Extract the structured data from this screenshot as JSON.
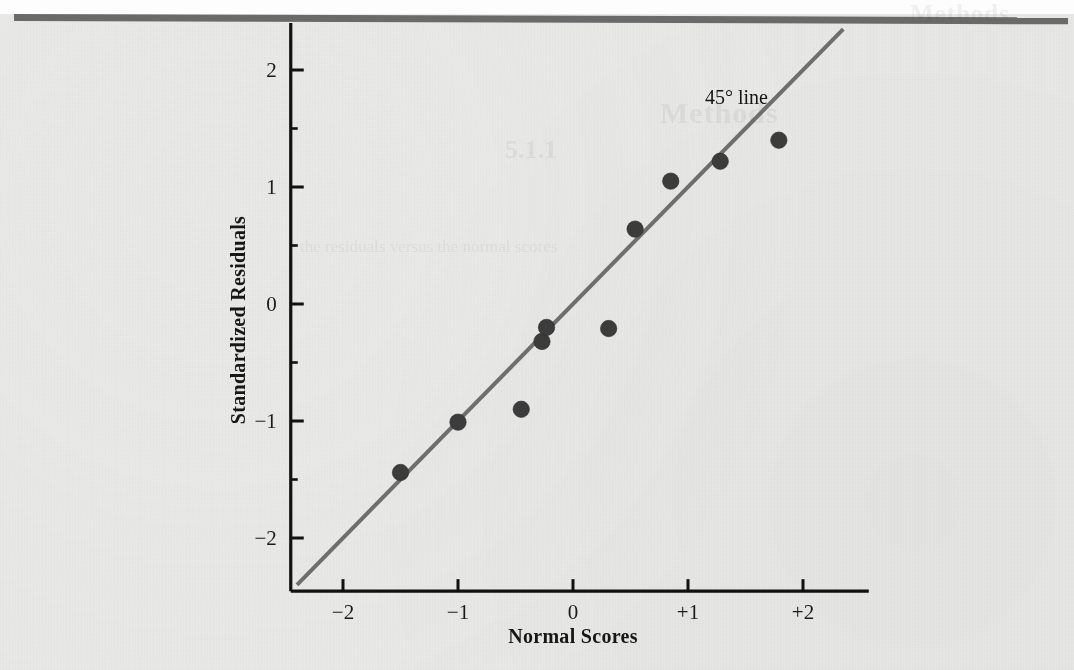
{
  "page": {
    "background_color": "#e9e9e7",
    "rule_color": "#6a6a6a"
  },
  "ghost_text": {
    "header": "Methods",
    "title": "Methods",
    "subtitle": "5.1.1",
    "body": "the residuals versus the normal scores"
  },
  "annotation": {
    "label_45": "45° line"
  },
  "chart_data": {
    "type": "scatter",
    "title": "",
    "xlabel": "Normal Scores",
    "ylabel": "Standardized Residuals",
    "xlim": [
      -2.45,
      2.45
    ],
    "ylim": [
      -2.45,
      2.3
    ],
    "grid": false,
    "legend": "none",
    "marker_color": "#3c3c3c",
    "line_color": "#6e6e6e",
    "axis_color": "#111111",
    "xticks": [
      -2,
      -1,
      0,
      1,
      2
    ],
    "xtick_labels": [
      "−2",
      "−1",
      "0",
      "+1",
      "+2"
    ],
    "yticks": [
      2,
      1,
      0,
      -1,
      -2
    ],
    "ytick_labels": [
      "2",
      "1",
      "0",
      "−1",
      "−2"
    ],
    "x": [
      -1.5,
      -1.0,
      -0.45,
      -0.27,
      -0.23,
      0.31,
      0.54,
      0.85,
      1.28,
      1.79
    ],
    "y": [
      -1.44,
      -1.01,
      -0.9,
      -0.32,
      -0.2,
      -0.21,
      0.64,
      1.05,
      1.22,
      1.4
    ],
    "reference_line": {
      "name": "45° line",
      "slope": 1,
      "intercept": 0,
      "x_start": -2.4,
      "x_end": 2.35,
      "color": "#6e6e6e",
      "width": 4
    }
  }
}
